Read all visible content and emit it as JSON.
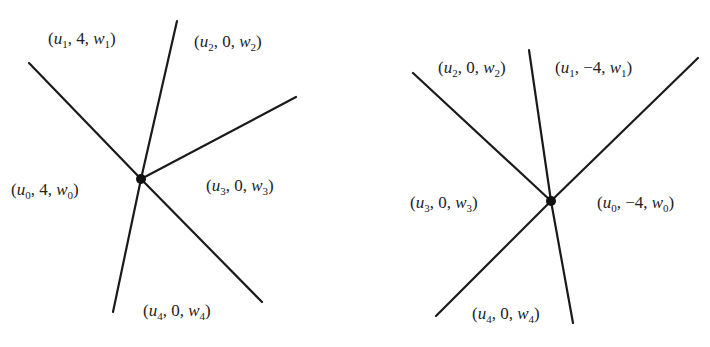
{
  "diagrams": [
    {
      "name": "left-tropical-vertex",
      "vertex": {
        "x": 141,
        "y": 179
      },
      "edges": [
        {
          "to": [
            29,
            63
          ]
        },
        {
          "to": [
            177,
            21
          ]
        },
        {
          "to": [
            296,
            97
          ]
        },
        {
          "to": [
            262,
            302
          ]
        },
        {
          "to": [
            113,
            312
          ]
        }
      ],
      "labels": [
        {
          "u": "1",
          "mid": "4",
          "w": "1",
          "x": 48,
          "y": 30
        },
        {
          "u": "2",
          "mid": "0",
          "w": "2",
          "x": 194,
          "y": 33
        },
        {
          "u": "0",
          "mid": "4",
          "w": "0",
          "x": 11,
          "y": 181
        },
        {
          "u": "3",
          "mid": "0",
          "w": "3",
          "x": 206,
          "y": 177
        },
        {
          "u": "4",
          "mid": "0",
          "w": "4",
          "x": 143,
          "y": 302
        }
      ]
    },
    {
      "name": "right-tropical-vertex",
      "vertex": {
        "x": 551,
        "y": 201
      },
      "edges": [
        {
          "to": [
            413,
            73
          ]
        },
        {
          "to": [
            529,
            50
          ]
        },
        {
          "to": [
            698,
            58
          ]
        },
        {
          "to": [
            436,
            316
          ]
        },
        {
          "to": [
            573,
            323
          ]
        }
      ],
      "labels": [
        {
          "u": "2",
          "mid": "0",
          "w": "2",
          "x": 438,
          "y": 59
        },
        {
          "u": "1",
          "mid": "−4",
          "w": "1",
          "x": 555,
          "y": 59
        },
        {
          "u": "3",
          "mid": "0",
          "w": "3",
          "x": 410,
          "y": 194
        },
        {
          "u": "0",
          "mid": "−4",
          "w": "0",
          "x": 597,
          "y": 194
        },
        {
          "u": "4",
          "mid": "0",
          "w": "4",
          "x": 472,
          "y": 305
        }
      ]
    }
  ]
}
